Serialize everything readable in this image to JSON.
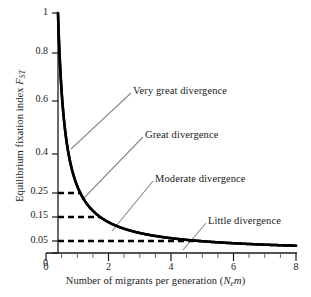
{
  "chart_data": {
    "type": "line",
    "title": "",
    "subtitle": "",
    "xlabel": "Number of migrants per generation (Nem)",
    "ylabel": "Equilibrium fixation index FST",
    "xlabel_parts": {
      "text": "Number of migrants per generation (",
      "symbol_n": "N",
      "symbol_sub": "e",
      "symbol_m": "m",
      "close": ")"
    },
    "ylabel_parts": {
      "text": "Equilibrium fixation index ",
      "symbol_f": "F",
      "symbol_sub": "ST"
    },
    "xlim": [
      0,
      8
    ],
    "ylim": [
      0,
      1
    ],
    "grid": false,
    "legend": "none",
    "equation": "FST = 1 / (1 + 4 Nem)",
    "x_ticks": [
      0,
      2,
      4,
      6,
      8
    ],
    "x_tick_labels": [
      "0",
      "2",
      "4",
      "6",
      "8"
    ],
    "x_minor_tick_step": 0.5,
    "y_ticks": [
      0,
      0.05,
      0.15,
      0.25,
      0.4,
      0.6,
      0.8,
      1
    ],
    "y_tick_labels": [
      "0",
      "0.05",
      "0.15",
      "0.25",
      "0.4",
      "0.6",
      "0.8",
      "1"
    ],
    "series": [
      {
        "name": "Equilibrium Fst",
        "color": "#000000",
        "x": [
          0,
          0.1,
          0.2,
          0.3,
          0.4,
          0.5,
          0.6,
          0.75,
          0.9,
          1.0,
          1.2,
          1.42,
          1.6,
          1.8,
          2.0,
          2.5,
          3.0,
          3.5,
          4.0,
          4.75,
          5.5,
          6.0,
          7.0,
          8.0
        ],
        "y": [
          1.0,
          0.714,
          0.556,
          0.455,
          0.385,
          0.333,
          0.294,
          0.25,
          0.217,
          0.2,
          0.172,
          0.15,
          0.135,
          0.122,
          0.111,
          0.091,
          0.077,
          0.067,
          0.059,
          0.05,
          0.043,
          0.04,
          0.034,
          0.03
        ]
      }
    ],
    "reference_lines": [
      {
        "name": "fst-025",
        "y": 0.25,
        "x_end": 0.75,
        "style": "dashed"
      },
      {
        "name": "fst-015",
        "y": 0.15,
        "x_end": 1.42,
        "style": "dashed"
      },
      {
        "name": "fst-005",
        "y": 0.05,
        "x_end": 4.75,
        "style": "dashed"
      }
    ],
    "annotations": [
      {
        "label": "Very great divergence",
        "label_x": 133,
        "label_y": 86,
        "leader_from_x": 130,
        "leader_from_y": 96,
        "leader_to_x": 74,
        "leader_to_y": 145
      },
      {
        "label": "Great divergence",
        "label_x": 145,
        "label_y": 130,
        "leader_from_x": 142,
        "leader_from_y": 140,
        "leader_to_x": 84,
        "leader_to_y": 197
      },
      {
        "label": "Moderate divergence",
        "label_x": 155,
        "label_y": 174,
        "leader_from_x": 152,
        "leader_from_y": 184,
        "leader_to_x": 113,
        "leader_to_y": 228
      },
      {
        "label": "Little divergence",
        "label_x": 208,
        "label_y": 216,
        "leader_from_x": 205,
        "leader_from_y": 226,
        "leader_to_x": 184,
        "leader_to_y": 248
      }
    ]
  },
  "colors": {
    "curve": "#000000",
    "axis": "#1a1a1a",
    "dashed": "#000000",
    "leader": "#8a8a8a",
    "background": "#ffffff"
  },
  "ticks": {
    "y": [
      {
        "value": "1",
        "top": 6
      },
      {
        "value": "0.8",
        "top": 45
      },
      {
        "value": "0.6",
        "top": 93
      },
      {
        "value": "0.4",
        "top": 146
      },
      {
        "value": "0.25",
        "top": 185
      },
      {
        "value": "0.15",
        "top": 209
      },
      {
        "value": "0.05",
        "top": 234
      }
    ],
    "y_zero": {
      "value": "0",
      "top": 257
    },
    "x": [
      {
        "value": "0",
        "left": 46
      },
      {
        "value": "2",
        "left": 114
      },
      {
        "value": "4",
        "left": 175
      },
      {
        "value": "6",
        "left": 236
      },
      {
        "value": "8",
        "left": 296
      }
    ]
  },
  "annotation_labels": {
    "very_great": "Very great divergence",
    "great": "Great divergence",
    "moderate": "Moderate divergence",
    "little": "Little divergence"
  }
}
